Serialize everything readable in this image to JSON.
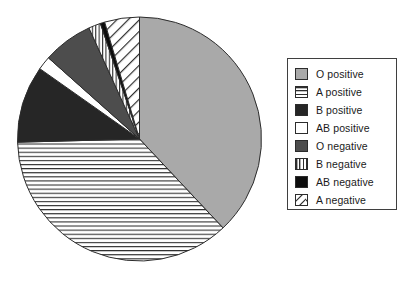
{
  "chart_data": {
    "type": "pie",
    "title": "",
    "xlabel": "",
    "ylabel": "",
    "legend_position": "right",
    "grid": false,
    "start_angle_deg": 0,
    "direction": "clockwise",
    "categories": [
      "O positive",
      "A positive",
      "B positive",
      "AB positive",
      "O negative",
      "B negative",
      "AB negative",
      "A negative"
    ],
    "values": [
      38.0,
      36.6,
      10.2,
      1.8,
      6.6,
      1.6,
      0.6,
      4.6
    ],
    "units": "percent",
    "slices": [
      {
        "label": "O positive",
        "value": 38.0,
        "start_deg": 0.0,
        "end_deg": 136.8,
        "fill": "solid",
        "color": "#a9a9a9",
        "pattern": "none"
      },
      {
        "label": "A positive",
        "value": 36.6,
        "start_deg": 136.8,
        "end_deg": 268.5,
        "fill": "pattern",
        "color": "#ffffff",
        "pattern": "horizontal-lines"
      },
      {
        "label": "B positive",
        "value": 10.2,
        "start_deg": 268.5,
        "end_deg": 305.2,
        "fill": "solid",
        "color": "#262626",
        "pattern": "none"
      },
      {
        "label": "AB positive",
        "value": 1.8,
        "start_deg": 305.2,
        "end_deg": 311.7,
        "fill": "solid",
        "color": "#ffffff",
        "pattern": "none"
      },
      {
        "label": "O negative",
        "value": 6.6,
        "start_deg": 311.7,
        "end_deg": 335.5,
        "fill": "solid",
        "color": "#4d4d4d",
        "pattern": "none"
      },
      {
        "label": "B negative",
        "value": 1.6,
        "start_deg": 335.5,
        "end_deg": 341.3,
        "fill": "pattern",
        "color": "#ffffff",
        "pattern": "vertical-lines"
      },
      {
        "label": "AB negative",
        "value": 0.6,
        "start_deg": 341.3,
        "end_deg": 343.4,
        "fill": "solid",
        "color": "#0d0d0d",
        "pattern": "none"
      },
      {
        "label": "A negative",
        "value": 4.6,
        "start_deg": 343.4,
        "end_deg": 360.0,
        "fill": "pattern",
        "color": "#ffffff",
        "pattern": "diagonal-lines"
      }
    ]
  },
  "legend": {
    "items": [
      {
        "label": "O positive",
        "swatch": "swatch-solid-gray"
      },
      {
        "label": "A positive",
        "swatch": "swatch-horizontal-lines"
      },
      {
        "label": "B positive",
        "swatch": "swatch-dark"
      },
      {
        "label": "AB positive",
        "swatch": "swatch-white"
      },
      {
        "label": "O negative",
        "swatch": "swatch-dark-gray"
      },
      {
        "label": "B negative",
        "swatch": "swatch-vertical-lines"
      },
      {
        "label": "AB negative",
        "swatch": "swatch-black"
      },
      {
        "label": "A negative",
        "swatch": "swatch-diagonal-lines"
      }
    ]
  },
  "colors": {
    "o_positive": "#a9a9a9",
    "o_negative": "#4d4d4d",
    "b_positive": "#262626",
    "ab_negative": "#0d0d0d",
    "outline": "#2c2c2c",
    "background": "#ffffff"
  }
}
